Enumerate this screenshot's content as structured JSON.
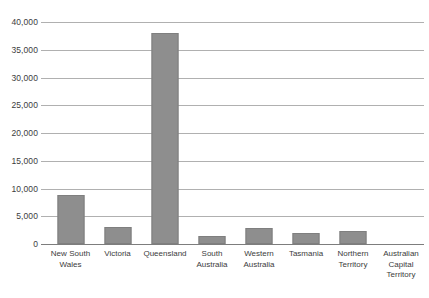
{
  "chart_data": {
    "type": "bar",
    "title": "",
    "subtitle": "",
    "xlabel": "",
    "ylabel": "",
    "categories": [
      "New South Wales",
      "Victoria",
      "Queensland",
      "South Australia",
      "Western Australia",
      "Tasmania",
      "Northern Territory",
      "Australian Capital Territory"
    ],
    "values": [
      8900,
      3000,
      38100,
      1500,
      2800,
      1900,
      2400,
      0
    ],
    "ylim": [
      0,
      40000
    ],
    "ytick_values": [
      0,
      5000,
      10000,
      15000,
      20000,
      25000,
      30000,
      35000,
      40000
    ],
    "ytick_labels": [
      "0",
      "5,000",
      "10,000",
      "15,000",
      "20,000",
      "25,000",
      "30,000",
      "35,000",
      "40,000"
    ],
    "grid": true,
    "legend": false,
    "legend_position": "none",
    "bar_color": "#8e8e8e",
    "bar_border_color": "#7f7f7f",
    "gridline_color": "#b0b0b0",
    "axis_color": "#7d7d7d",
    "text_color": "#3c3c3c",
    "background_color": "#ffffff"
  }
}
